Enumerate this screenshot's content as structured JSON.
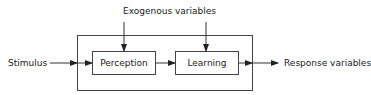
{
  "diagram": {
    "top_label": "Exogenous variables",
    "input_label": "Stimulus",
    "output_label": "Response variables",
    "boxes": [
      {
        "label": "Perception"
      },
      {
        "label": "Learning"
      }
    ],
    "colors": {
      "stroke": "#333333",
      "text": "#1a1a1a",
      "background": "#ffffff"
    }
  }
}
